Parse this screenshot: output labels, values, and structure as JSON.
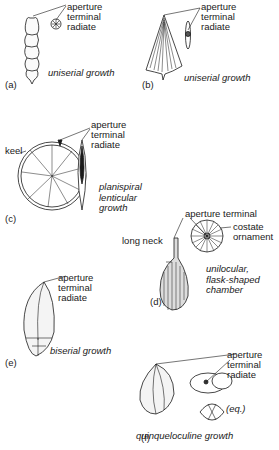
{
  "figure": {
    "panels": [
      {
        "id": "a",
        "panel_label": "(a)",
        "callout": [
          "aperture",
          "terminal",
          "radiate"
        ],
        "caption": [
          "uniserial growth"
        ]
      },
      {
        "id": "b",
        "panel_label": "(b)",
        "callout": [
          "aperture",
          "terminal",
          "radiate"
        ],
        "caption": [
          "uniserial growth"
        ]
      },
      {
        "id": "c",
        "panel_label": "(c)",
        "side_label": "keel",
        "callout": [
          "aperture",
          "terminal",
          "radiate"
        ],
        "caption": [
          "planispiral",
          "lenticular",
          "growth"
        ]
      },
      {
        "id": "d",
        "panel_label": "(d)",
        "side_label": "long neck",
        "callout": [
          "aperture terminal"
        ],
        "ornament_label": [
          "costate",
          "ornament"
        ],
        "caption": [
          "unilocular,",
          "flask-shaped",
          "chamber"
        ]
      },
      {
        "id": "e",
        "panel_label": "(e)",
        "callout": [
          "aperture",
          "terminal",
          "radiate"
        ],
        "caption": [
          "biserial growth"
        ]
      },
      {
        "id": "f",
        "panel_label": "(f)",
        "callout": [
          "aperture",
          "terminal",
          "radiate"
        ],
        "view_label": "(eq.)",
        "caption": [
          "quinqueloculine growth"
        ]
      }
    ]
  }
}
